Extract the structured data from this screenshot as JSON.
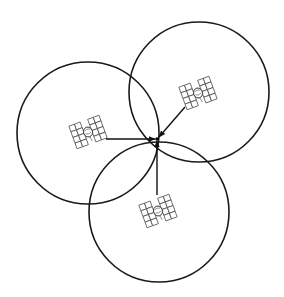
{
  "diagram": {
    "title": "",
    "colors": {
      "background": "#ffffff",
      "stroke": "#1a1a1a"
    },
    "fix_point": {
      "x": 157,
      "y": 139,
      "r": 1.8
    },
    "satellites": [
      {
        "id": "left",
        "icon": "satellite-icon",
        "center": {
          "x": 88,
          "y": 133
        },
        "range_radius": 71,
        "sat_pos": {
          "x": 88,
          "y": 132
        },
        "rotation": -20,
        "arrow": {
          "x1": 106,
          "y1": 139,
          "x2": 155,
          "y2": 139
        }
      },
      {
        "id": "upper-right",
        "icon": "satellite-icon",
        "center": {
          "x": 199,
          "y": 92
        },
        "range_radius": 70,
        "sat_pos": {
          "x": 198,
          "y": 93
        },
        "rotation": -20,
        "arrow": {
          "x1": 185,
          "y1": 107,
          "x2": 159,
          "y2": 137
        }
      },
      {
        "id": "bottom",
        "icon": "satellite-icon",
        "center": {
          "x": 159,
          "y": 212
        },
        "range_radius": 70,
        "sat_pos": {
          "x": 158,
          "y": 211
        },
        "rotation": -20,
        "arrow": {
          "x1": 157,
          "y1": 195,
          "x2": 157,
          "y2": 141
        }
      }
    ]
  }
}
